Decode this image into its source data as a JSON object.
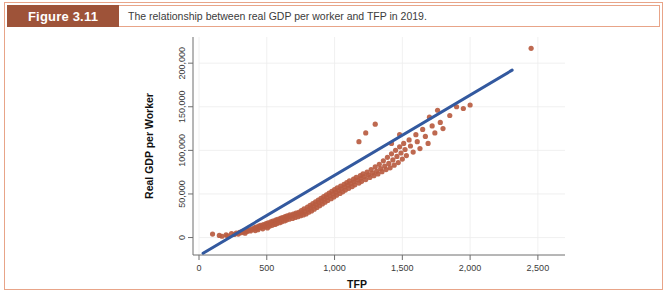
{
  "figure": {
    "label": "Figure 3.11",
    "caption": "The relationship between real GDP per worker and TFP in 2019."
  },
  "colors": {
    "label_box": "#9e5339",
    "border": "#e8a488",
    "dot": "#b95c41",
    "trend_line": "#33599f",
    "grid": "#ececec",
    "axis": "#6e6e6e"
  },
  "chart_data": {
    "type": "scatter",
    "title": "",
    "xlabel": "TFP",
    "ylabel": "Real GDP per Worker",
    "xlim": [
      0,
      2700
    ],
    "ylim": [
      -20000,
      230000
    ],
    "xticks": [
      0,
      500,
      1000,
      1500,
      2000,
      2500
    ],
    "xticklabels": [
      "0",
      "500",
      "1,000",
      "1,500",
      "2,000",
      "2,500"
    ],
    "yticks": [
      0,
      50000,
      100000,
      150000,
      200000
    ],
    "yticklabels": [
      "0",
      "50,000",
      "100,000",
      "150,000",
      "200,000"
    ],
    "grid": true,
    "legend": "none",
    "series": [
      {
        "name": "Countries",
        "marker": "circle",
        "color": "#b95c41",
        "points": [
          [
            100,
            4000
          ],
          [
            150,
            2500
          ],
          [
            170,
            1500
          ],
          [
            200,
            3000
          ],
          [
            210,
            2000
          ],
          [
            240,
            4500
          ],
          [
            260,
            3500
          ],
          [
            275,
            5000
          ],
          [
            290,
            4000
          ],
          [
            300,
            6000
          ],
          [
            310,
            5500
          ],
          [
            320,
            7000
          ],
          [
            330,
            6500
          ],
          [
            340,
            5000
          ],
          [
            350,
            8000
          ],
          [
            355,
            7000
          ],
          [
            360,
            9000
          ],
          [
            370,
            8500
          ],
          [
            380,
            7500
          ],
          [
            390,
            10000
          ],
          [
            400,
            9500
          ],
          [
            410,
            11000
          ],
          [
            415,
            8000
          ],
          [
            420,
            12000
          ],
          [
            430,
            10500
          ],
          [
            435,
            9000
          ],
          [
            440,
            13000
          ],
          [
            450,
            11500
          ],
          [
            455,
            14000
          ],
          [
            460,
            12000
          ],
          [
            470,
            10000
          ],
          [
            475,
            15000
          ],
          [
            480,
            13500
          ],
          [
            490,
            12500
          ],
          [
            495,
            16000
          ],
          [
            500,
            14500
          ],
          [
            505,
            11000
          ],
          [
            510,
            17000
          ],
          [
            515,
            15500
          ],
          [
            520,
            13000
          ],
          [
            530,
            18000
          ],
          [
            535,
            16500
          ],
          [
            540,
            14000
          ],
          [
            545,
            19000
          ],
          [
            550,
            17500
          ],
          [
            560,
            15000
          ],
          [
            565,
            20000
          ],
          [
            570,
            18500
          ],
          [
            575,
            16000
          ],
          [
            580,
            21000
          ],
          [
            590,
            19500
          ],
          [
            595,
            17000
          ],
          [
            600,
            22000
          ],
          [
            605,
            20500
          ],
          [
            610,
            18000
          ],
          [
            615,
            23000
          ],
          [
            620,
            21500
          ],
          [
            630,
            19000
          ],
          [
            635,
            24000
          ],
          [
            640,
            22500
          ],
          [
            645,
            20000
          ],
          [
            650,
            25000
          ],
          [
            660,
            23500
          ],
          [
            665,
            21000
          ],
          [
            670,
            26000
          ],
          [
            680,
            24500
          ],
          [
            690,
            22000
          ],
          [
            695,
            27000
          ],
          [
            700,
            25500
          ],
          [
            710,
            23000
          ],
          [
            715,
            28000
          ],
          [
            720,
            26500
          ],
          [
            730,
            24000
          ],
          [
            735,
            29000
          ],
          [
            740,
            27500
          ],
          [
            750,
            25000
          ],
          [
            755,
            31000
          ],
          [
            760,
            28500
          ],
          [
            770,
            26000
          ],
          [
            775,
            33000
          ],
          [
            780,
            30000
          ],
          [
            790,
            27000
          ],
          [
            800,
            35000
          ],
          [
            805,
            32000
          ],
          [
            810,
            29000
          ],
          [
            820,
            37000
          ],
          [
            825,
            34000
          ],
          [
            830,
            30500
          ],
          [
            840,
            39000
          ],
          [
            845,
            36000
          ],
          [
            850,
            32500
          ],
          [
            860,
            41000
          ],
          [
            865,
            38000
          ],
          [
            870,
            34500
          ],
          [
            880,
            43000
          ],
          [
            885,
            40000
          ],
          [
            890,
            36500
          ],
          [
            900,
            45000
          ],
          [
            905,
            42000
          ],
          [
            910,
            38500
          ],
          [
            920,
            47000
          ],
          [
            925,
            44000
          ],
          [
            930,
            40500
          ],
          [
            940,
            49000
          ],
          [
            945,
            46000
          ],
          [
            950,
            42500
          ],
          [
            960,
            51000
          ],
          [
            965,
            48000
          ],
          [
            975,
            44500
          ],
          [
            980,
            53000
          ],
          [
            990,
            50000
          ],
          [
            995,
            46500
          ],
          [
            1000,
            55000
          ],
          [
            1010,
            52000
          ],
          [
            1015,
            48500
          ],
          [
            1020,
            57000
          ],
          [
            1030,
            54000
          ],
          [
            1040,
            50500
          ],
          [
            1045,
            59000
          ],
          [
            1050,
            56000
          ],
          [
            1060,
            52500
          ],
          [
            1070,
            61000
          ],
          [
            1075,
            58000
          ],
          [
            1080,
            54500
          ],
          [
            1090,
            63000
          ],
          [
            1100,
            60000
          ],
          [
            1105,
            56500
          ],
          [
            1110,
            65000
          ],
          [
            1120,
            62000
          ],
          [
            1130,
            58500
          ],
          [
            1140,
            67000
          ],
          [
            1145,
            64000
          ],
          [
            1150,
            60500
          ],
          [
            1160,
            69000
          ],
          [
            1170,
            66000
          ],
          [
            1180,
            62500
          ],
          [
            1190,
            71000
          ],
          [
            1195,
            68000
          ],
          [
            1200,
            64500
          ],
          [
            1210,
            73000
          ],
          [
            1220,
            70000
          ],
          [
            1230,
            66500
          ],
          [
            1240,
            75000
          ],
          [
            1250,
            72000
          ],
          [
            1260,
            69000
          ],
          [
            1270,
            78000
          ],
          [
            1280,
            74000
          ],
          [
            1290,
            71000
          ],
          [
            1300,
            81000
          ],
          [
            1310,
            76000
          ],
          [
            1320,
            73000
          ],
          [
            1330,
            84000
          ],
          [
            1340,
            79000
          ],
          [
            1350,
            75500
          ],
          [
            1360,
            88000
          ],
          [
            1370,
            82000
          ],
          [
            1380,
            78000
          ],
          [
            1390,
            92000
          ],
          [
            1400,
            85000
          ],
          [
            1410,
            80000
          ],
          [
            1420,
            96000
          ],
          [
            1430,
            89000
          ],
          [
            1440,
            83000
          ],
          [
            1450,
            100000
          ],
          [
            1460,
            93000
          ],
          [
            1470,
            86000
          ],
          [
            1480,
            104000
          ],
          [
            1490,
            97000
          ],
          [
            1500,
            90000
          ],
          [
            1510,
            108000
          ],
          [
            1520,
            101000
          ],
          [
            1530,
            94000
          ],
          [
            1550,
            112000
          ],
          [
            1560,
            105000
          ],
          [
            1580,
            98000
          ],
          [
            1600,
            118000
          ],
          [
            1610,
            110000
          ],
          [
            1630,
            102000
          ],
          [
            1650,
            124000
          ],
          [
            1670,
            116000
          ],
          [
            1690,
            108000
          ],
          [
            1700,
            138000
          ],
          [
            1720,
            128000
          ],
          [
            1740,
            120000
          ],
          [
            1760,
            146000
          ],
          [
            1780,
            132000
          ],
          [
            1800,
            125000
          ],
          [
            1850,
            140000
          ],
          [
            1900,
            150000
          ],
          [
            1950,
            148000
          ],
          [
            2000,
            152000
          ],
          [
            1230,
            120000
          ],
          [
            1300,
            130000
          ],
          [
            1180,
            110000
          ],
          [
            1420,
            108000
          ],
          [
            1480,
            118000
          ],
          [
            2450,
            217000
          ]
        ]
      }
    ],
    "trend_line": {
      "name": "Fitted line",
      "color": "#33599f",
      "x0": 30,
      "y0": -18000,
      "x1": 2310,
      "y1": 192000
    }
  }
}
